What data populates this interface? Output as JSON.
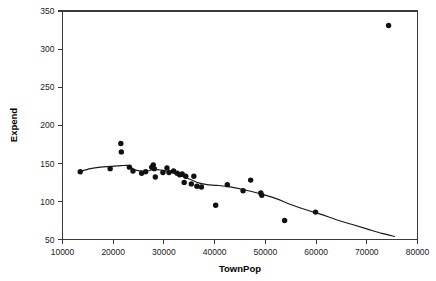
{
  "chart_data": {
    "type": "scatter",
    "title": "",
    "xlabel": "TownPop",
    "ylabel": "Expend",
    "xlim": [
      10000,
      80000
    ],
    "ylim": [
      50,
      350
    ],
    "xticks": [
      10000,
      20000,
      30000,
      40000,
      50000,
      60000,
      70000,
      80000
    ],
    "yticks": [
      50,
      100,
      150,
      200,
      250,
      300,
      350
    ],
    "xtick_labels": [
      "10000",
      "20000",
      "30000",
      "40000",
      "50000",
      "60000",
      "70000",
      "80000"
    ],
    "ytick_labels": [
      "50",
      "100",
      "150",
      "200",
      "250",
      "300",
      "350"
    ],
    "grid": false,
    "legend": "none",
    "marker": "filled-circle",
    "marker_color": "#111111",
    "curve_color": "#1a1a1a",
    "axis_color": "#3a3a3a",
    "background_color": "#ffffff",
    "series": [
      {
        "name": "Expend vs TownPop",
        "points": [
          [
            13500,
            139
          ],
          [
            19400,
            143
          ],
          [
            21500,
            176
          ],
          [
            21600,
            165
          ],
          [
            23200,
            145
          ],
          [
            23900,
            140
          ],
          [
            25600,
            137
          ],
          [
            26400,
            139
          ],
          [
            27600,
            145
          ],
          [
            27900,
            148
          ],
          [
            28100,
            143
          ],
          [
            28300,
            132
          ],
          [
            29800,
            138
          ],
          [
            30600,
            144
          ],
          [
            31000,
            138
          ],
          [
            31900,
            140
          ],
          [
            32600,
            137
          ],
          [
            33100,
            135
          ],
          [
            33600,
            136
          ],
          [
            34000,
            125
          ],
          [
            34300,
            133
          ],
          [
            35400,
            123
          ],
          [
            35900,
            133
          ],
          [
            36500,
            120
          ],
          [
            37400,
            119
          ],
          [
            40200,
            95
          ],
          [
            42500,
            122
          ],
          [
            45600,
            114
          ],
          [
            47100,
            128
          ],
          [
            49100,
            111
          ],
          [
            49300,
            108
          ],
          [
            53800,
            75
          ],
          [
            59900,
            86
          ],
          [
            74300,
            331
          ]
        ]
      }
    ],
    "fit_curve": {
      "name": "lowess-smoother",
      "points": [
        [
          13400,
          139
        ],
        [
          15500,
          143
        ],
        [
          17500,
          145
        ],
        [
          19500,
          146
        ],
        [
          21500,
          147
        ],
        [
          23200,
          147
        ],
        [
          24000,
          142
        ],
        [
          25500,
          140
        ],
        [
          26800,
          140
        ],
        [
          28000,
          142
        ],
        [
          29500,
          141
        ],
        [
          31000,
          139
        ],
        [
          32500,
          136
        ],
        [
          34000,
          132
        ],
        [
          35500,
          128
        ],
        [
          37000,
          124
        ],
        [
          38500,
          122
        ],
        [
          40500,
          121
        ],
        [
          43000,
          119
        ],
        [
          46000,
          115
        ],
        [
          49000,
          110
        ],
        [
          52000,
          104
        ],
        [
          55000,
          96
        ],
        [
          58000,
          89
        ],
        [
          61000,
          83
        ],
        [
          64000,
          76
        ],
        [
          67000,
          70
        ],
        [
          70000,
          64
        ],
        [
          73000,
          58
        ],
        [
          75500,
          54
        ]
      ]
    }
  }
}
